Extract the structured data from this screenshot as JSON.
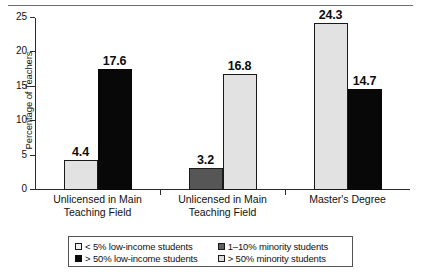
{
  "figure": {
    "top_rule": true,
    "axis": {
      "y_title": "Percentage of Teachers",
      "y_ticks": [
        "0",
        "5",
        "10",
        "15",
        "20",
        "25"
      ],
      "y_min": 0,
      "y_max": 25
    }
  },
  "chart_data": {
    "type": "bar",
    "title": "",
    "xlabel": "",
    "ylabel": "Percentage of Teachers",
    "ylim": [
      0,
      25
    ],
    "ytick_values": [
      0,
      5,
      10,
      15,
      20,
      25
    ],
    "grid": false,
    "legend_position": "bottom",
    "categories": [
      "Unlicensed in Main Teaching Field",
      "Unlicensed in Main Teaching Field",
      "Master's Degree"
    ],
    "category_lines": [
      [
        "Unlicensed in Main",
        "Teaching Field"
      ],
      [
        "Unlicensed in Main",
        "Teaching Field"
      ],
      [
        "Master's Degree"
      ]
    ],
    "series": [
      {
        "name": "< 5% low-income students",
        "key": "low_income_lt5",
        "color": "#e2e2e2",
        "values": [
          4.4,
          null,
          null
        ]
      },
      {
        "name": "> 50% low-income students",
        "key": "low_income_gt50",
        "color": "#080808",
        "values": [
          17.6,
          null,
          14.7
        ]
      },
      {
        "name": "1–10% minority students",
        "key": "minority_1_10",
        "color": "#565656",
        "values": [
          null,
          3.2,
          null
        ]
      },
      {
        "name": "> 50% minority students",
        "key": "minority_gt50",
        "color": "#e2e2e2",
        "values": [
          null,
          16.8,
          24.3
        ]
      }
    ],
    "bars": [
      {
        "group": 0,
        "series": "low_income_lt5",
        "value": 4.4,
        "label": "4.4",
        "fill": "light"
      },
      {
        "group": 0,
        "series": "low_income_gt50",
        "value": 17.6,
        "label": "17.6",
        "fill": "black"
      },
      {
        "group": 1,
        "series": "minority_1_10",
        "value": 3.2,
        "label": "3.2",
        "fill": "dark"
      },
      {
        "group": 1,
        "series": "minority_gt50",
        "value": 16.8,
        "label": "16.8",
        "fill": "light"
      },
      {
        "group": 2,
        "series": "minority_gt50",
        "value": 24.3,
        "label": "24.3",
        "fill": "light"
      },
      {
        "group": 2,
        "series": "low_income_gt50",
        "value": 14.7,
        "label": "14.7",
        "fill": "black"
      }
    ]
  },
  "legend": {
    "entries": [
      {
        "label": "< 5% low-income students",
        "swatch": "light",
        "color": "#f0f0f0"
      },
      {
        "label": "1–10% minority students",
        "swatch": "dark",
        "color": "#606060"
      },
      {
        "label": "> 50% low-income students",
        "swatch": "black",
        "color": "#0a0a0a"
      },
      {
        "label": "> 50% minority students",
        "swatch": "lgray",
        "color": "#dcdcdc"
      }
    ]
  }
}
